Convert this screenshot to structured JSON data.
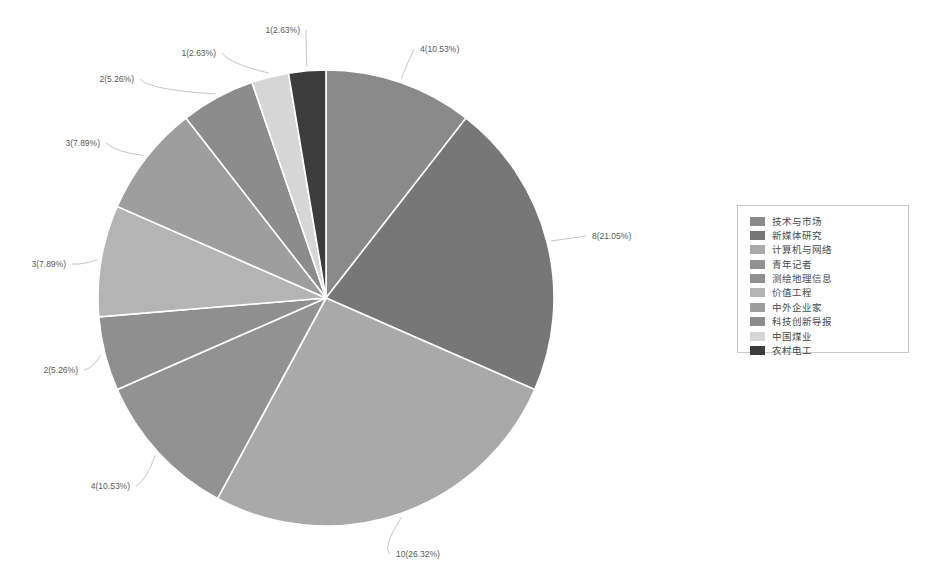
{
  "chart_data": {
    "type": "pie",
    "title": "",
    "total": 38,
    "legend_position": "right",
    "categories": [
      "技术与市场",
      "新媒体研究",
      "计算机与网络",
      "青年记者",
      "测绘地理信息",
      "价值工程",
      "中外企业家",
      "科技创新导报",
      "中国煤业",
      "农村电工"
    ],
    "values": [
      4,
      8,
      10,
      4,
      2,
      3,
      3,
      2,
      1,
      1
    ],
    "percentages": [
      10.53,
      21.05,
      26.32,
      10.53,
      5.26,
      7.89,
      7.89,
      5.26,
      2.63,
      2.63
    ],
    "data_labels": [
      "4(10.53%)",
      "8(21.05%)",
      "10(26.32%)",
      "4(10.53%)",
      "2(5.26%)",
      "3(7.89%)",
      "3(7.89%)",
      "2(5.26%)",
      "1(2.63%)",
      "1(2.63%)"
    ],
    "colors": [
      "#8a8a8a",
      "#777777",
      "#a9a9a9",
      "#929292",
      "#8f8f8f",
      "#b4b4b4",
      "#9e9e9e",
      "#8c8c8c",
      "#d6d6d6",
      "#3c3c3c"
    ]
  },
  "legend": {
    "items": [
      {
        "label": "技术与市场",
        "color": "#8a8a8a"
      },
      {
        "label": "新媒体研究",
        "color": "#777777"
      },
      {
        "label": "计算机与网络",
        "color": "#a9a9a9"
      },
      {
        "label": "青年记者",
        "color": "#929292"
      },
      {
        "label": "测绘地理信息",
        "color": "#8f8f8f"
      },
      {
        "label": "价值工程",
        "color": "#b4b4b4"
      },
      {
        "label": "中外企业家",
        "color": "#9e9e9e"
      },
      {
        "label": "科技创新导报",
        "color": "#8c8c8c"
      },
      {
        "label": "中国煤业",
        "color": "#d6d6d6"
      },
      {
        "label": "农村电工",
        "color": "#3c3c3c"
      }
    ]
  },
  "labels": {
    "top_right": "4(10.53%)",
    "right": "8(21.05%)",
    "bottom": "10(26.32%)",
    "lower_left": "4(10.53%)",
    "left_lower": "2(5.26%)",
    "left_mid": "3(7.89%)",
    "left_upper": "3(7.89%)",
    "top_left_outer": "2(5.26%)",
    "top_left_inner": "1(2.63%)",
    "top_center": "1(2.63%)"
  }
}
